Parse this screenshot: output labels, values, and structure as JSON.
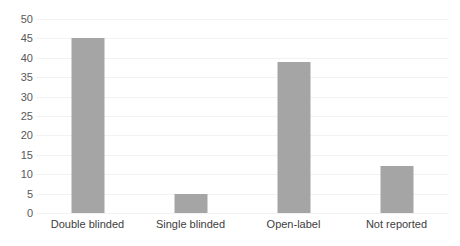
{
  "chart_data": {
    "type": "bar",
    "title": "",
    "subtitle": "",
    "xlabel": "",
    "ylabel": "",
    "categories": [
      "Double blinded",
      "Single blinded",
      "Open-label",
      "Not reported"
    ],
    "values": [
      45,
      5,
      39,
      12
    ],
    "ylim": [
      0,
      50
    ],
    "ytick_labels": [
      "0",
      "5",
      "10",
      "15",
      "20",
      "25",
      "30",
      "35",
      "40",
      "45",
      "50"
    ],
    "ytick_values": [
      0,
      5,
      10,
      15,
      20,
      25,
      30,
      35,
      40,
      45,
      50
    ],
    "grid": true,
    "grid_axis": "y",
    "legend": false,
    "legend_position": "none",
    "annotations": [],
    "colors": {
      "bar": "#a5a5a5",
      "gridline": "#f2f2f2",
      "ytick_text": "#595959",
      "xtick_text": "#404040",
      "background": "#ffffff"
    }
  }
}
